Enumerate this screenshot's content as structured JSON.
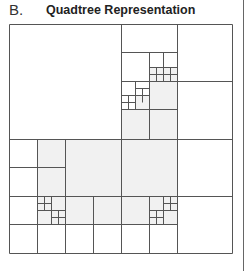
{
  "panel": {
    "letter": "B.",
    "title": "Quadtree Representation"
  },
  "diagram": {
    "origin": [
      9,
      24
    ],
    "size": 223,
    "height": 229,
    "line_color": "#555555",
    "fill_color": "#f1f1f1",
    "shaded_cells": [
      [
        149,
        81,
        28,
        28
      ],
      [
        121,
        109,
        28,
        30
      ],
      [
        149,
        109,
        28,
        30
      ],
      [
        121,
        139,
        56,
        57
      ],
      [
        65,
        139,
        56,
        57
      ],
      [
        37,
        139,
        28,
        28
      ],
      [
        37,
        167,
        28,
        29
      ],
      [
        93,
        196,
        28,
        28
      ],
      [
        121,
        196,
        28,
        28
      ],
      [
        65,
        196,
        28,
        28
      ],
      [
        44,
        203,
        7,
        7
      ],
      [
        51,
        210,
        14,
        14
      ],
      [
        149,
        196,
        14,
        14
      ],
      [
        163,
        210,
        14,
        14
      ],
      [
        163,
        196,
        14,
        14
      ],
      [
        149,
        210,
        14,
        14
      ],
      [
        135,
        95,
        14,
        14
      ],
      [
        149,
        67,
        28,
        14
      ],
      [
        37,
        196,
        28,
        28
      ]
    ],
    "lines": [
      [
        9,
        24,
        232,
        24
      ],
      [
        9,
        253,
        232,
        253
      ],
      [
        9,
        24,
        9,
        253
      ],
      [
        232,
        24,
        232,
        253
      ],
      [
        121,
        24,
        121,
        253
      ],
      [
        9,
        139,
        232,
        139
      ],
      [
        177,
        24,
        177,
        139
      ],
      [
        121,
        52,
        177,
        52
      ],
      [
        121,
        81,
        232,
        81
      ],
      [
        121,
        109,
        177,
        109
      ],
      [
        149,
        52,
        149,
        139
      ],
      [
        163,
        52,
        163,
        81
      ],
      [
        149,
        67,
        177,
        67
      ],
      [
        149,
        74,
        177,
        74
      ],
      [
        156,
        67,
        156,
        81
      ],
      [
        170,
        67,
        170,
        81
      ],
      [
        135,
        81,
        135,
        109
      ],
      [
        121,
        95,
        149,
        95
      ],
      [
        142,
        88,
        142,
        102
      ],
      [
        135,
        88,
        149,
        88
      ],
      [
        128,
        95,
        128,
        109
      ],
      [
        121,
        102,
        135,
        102
      ],
      [
        9,
        167,
        37,
        167
      ],
      [
        37,
        139,
        37,
        253
      ],
      [
        65,
        139,
        65,
        253
      ],
      [
        37,
        167,
        65,
        167
      ],
      [
        9,
        196,
        232,
        196
      ],
      [
        9,
        224,
        177,
        224
      ],
      [
        93,
        196,
        93,
        253
      ],
      [
        149,
        196,
        149,
        253
      ],
      [
        177,
        139,
        177,
        253
      ],
      [
        37,
        210,
        65,
        210
      ],
      [
        51,
        196,
        51,
        224
      ],
      [
        44,
        196,
        44,
        210
      ],
      [
        37,
        203,
        51,
        203
      ],
      [
        58,
        210,
        58,
        224
      ],
      [
        51,
        217,
        65,
        217
      ],
      [
        163,
        196,
        163,
        224
      ],
      [
        149,
        210,
        177,
        210
      ],
      [
        170,
        196,
        170,
        210
      ],
      [
        163,
        203,
        177,
        203
      ],
      [
        156,
        210,
        156,
        224
      ],
      [
        149,
        217,
        163,
        217
      ]
    ]
  }
}
